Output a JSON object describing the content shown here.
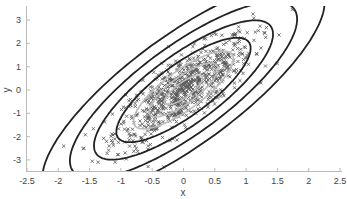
{
  "chart_data": {
    "type": "scatter",
    "title": "",
    "xlabel": "x",
    "ylabel": "y",
    "xlim": [
      -2.5,
      2.5
    ],
    "ylim": [
      -3.5,
      3.5
    ],
    "xticks": [
      "-2.5",
      "-2",
      "-1.5",
      "-1",
      "-0.5",
      "0",
      "0.5",
      "1",
      "1.5",
      "2",
      "2.5"
    ],
    "yticks": [
      "-3",
      "-2",
      "-1",
      "0",
      "1",
      "2",
      "3"
    ],
    "grid": false,
    "legend": null,
    "series": [
      {
        "name": "samples",
        "kind": "scatter",
        "marker": "x",
        "color": "#555555",
        "distribution": "bivariate normal, mean [0,0], positively correlated",
        "count_approx": 800
      },
      {
        "name": "inner density contours",
        "kind": "contour",
        "color": "#bbbbbb",
        "levels": 3,
        "center": [
          0,
          0
        ]
      },
      {
        "name": "outer density contours",
        "kind": "contour",
        "color": "#222222",
        "levels": 4,
        "center": [
          0,
          0
        ]
      }
    ]
  },
  "axes": {
    "x_label": "x",
    "y_label": "y"
  }
}
